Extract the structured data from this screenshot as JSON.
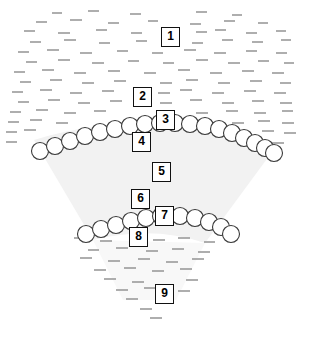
{
  "figure": {
    "background_color": "#ffffff",
    "width": 309,
    "height": 341,
    "wedge": {
      "name": "central-wedge",
      "fill_color": "#f2f2f2",
      "description": "light gray fan-shaped wedge narrowing downward"
    },
    "stipple": {
      "name": "dash-stipple-texture",
      "color": "#9a9a9a",
      "description": "short horizontal dashes filling the field around the wedge"
    },
    "arcs": [
      {
        "name": "upper-circle-arc",
        "circle_count": 19,
        "circle_diameter": 17,
        "circle_fill": "#ffffff",
        "circle_stroke": "#3a3a3a"
      },
      {
        "name": "lower-circle-arc",
        "circle_count": 15,
        "circle_diameter": 17,
        "circle_fill": "#ffffff",
        "circle_stroke": "#3a3a3a"
      }
    ],
    "labels": [
      {
        "id": "1",
        "text": "1",
        "x": 161,
        "y": 27
      },
      {
        "id": "2",
        "text": "2",
        "x": 133,
        "y": 87
      },
      {
        "id": "3",
        "text": "3",
        "x": 156,
        "y": 110
      },
      {
        "id": "4",
        "text": "4",
        "x": 132,
        "y": 132
      },
      {
        "id": "5",
        "text": "5",
        "x": 152,
        "y": 162
      },
      {
        "id": "6",
        "text": "6",
        "x": 131,
        "y": 189
      },
      {
        "id": "7",
        "text": "7",
        "x": 155,
        "y": 206
      },
      {
        "id": "8",
        "text": "8",
        "x": 129,
        "y": 227
      },
      {
        "id": "9",
        "text": "9",
        "x": 155,
        "y": 284
      }
    ]
  }
}
